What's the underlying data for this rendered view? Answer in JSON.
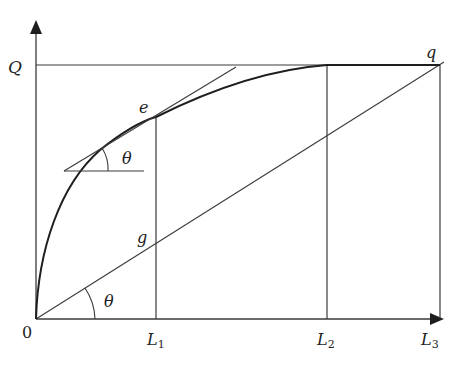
{
  "diagram": {
    "type": "geometric-curve-diagram",
    "colors": {
      "line": "#3a3a3a",
      "curve": "#1e1e1e",
      "text": "#222222",
      "background": "#ffffff"
    },
    "axes": {
      "origin_label": "0",
      "y_axis_label": "Q",
      "x_ticks": [
        {
          "base": "L",
          "sub": "1"
        },
        {
          "base": "L",
          "sub": "2"
        },
        {
          "base": "L",
          "sub": "3"
        }
      ]
    },
    "points": {
      "e": "e",
      "g": "g",
      "q": "q"
    },
    "angles": {
      "tangent_angle": "θ",
      "origin_angle": "θ"
    }
  }
}
